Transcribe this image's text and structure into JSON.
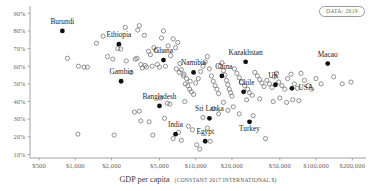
{
  "badge": {
    "label": "DATA: 2019",
    "name": "data-year-badge"
  },
  "chart_data": {
    "type": "scatter",
    "title": "",
    "subtitle": "",
    "xlabel": "GDP per capita",
    "xlabel_note": "(CONSTANT 2017 INTERNATIONAL $)",
    "ylabel": "",
    "xscale": "log",
    "yscale": "linear",
    "grid": false,
    "legend": "none",
    "xlim": [
      420,
      260000
    ],
    "ylim": [
      0.08,
      0.93
    ],
    "xticks": [
      500,
      1000,
      2000,
      5000,
      10000,
      20000,
      50000,
      100000,
      200000
    ],
    "xtick_labels": [
      "$500",
      "$1,000",
      "$2,000",
      "$5,000",
      "$10,000",
      "$20,000",
      "$50,000",
      "$100,000",
      "$200,000"
    ],
    "yticks": [
      0.1,
      0.2,
      0.3,
      0.4,
      0.5,
      0.6,
      0.7,
      0.8,
      0.9
    ],
    "ytick_labels": [
      "10%",
      "20%",
      "30%",
      "40%",
      "50%",
      "60%",
      "70%",
      "80%",
      "90%"
    ],
    "marker_styles": {
      "highlighted": "filled-black",
      "other": "open-circle"
    },
    "highlighted_points": [
      {
        "name": "Burundi",
        "x": 780,
        "y": 0.8,
        "label_dx": 0,
        "label_dy": -7
      },
      {
        "name": "Ethiopia",
        "x": 2300,
        "y": 0.725,
        "label_dx": 0,
        "label_dy": -7
      },
      {
        "name": "Ghana",
        "x": 5400,
        "y": 0.635,
        "label_dx": 0,
        "label_dy": -7
      },
      {
        "name": "Gambia",
        "x": 2400,
        "y": 0.515,
        "label_dx": 0,
        "label_dy": -7
      },
      {
        "name": "Namibia",
        "x": 9600,
        "y": 0.565,
        "label_dx": 0,
        "label_dy": -7
      },
      {
        "name": "Kazakhstan",
        "x": 26000,
        "y": 0.625,
        "label_dx": 0,
        "label_dy": -7
      },
      {
        "name": "China",
        "x": 16500,
        "y": 0.545,
        "label_dx": 2,
        "label_dy": -7
      },
      {
        "name": "Chile",
        "x": 25000,
        "y": 0.455,
        "label_dx": 3,
        "label_dy": -7
      },
      {
        "name": "UK",
        "x": 46000,
        "y": 0.495,
        "label_dx": -2,
        "label_dy": -7
      },
      {
        "name": "USA",
        "x": 63000,
        "y": 0.475,
        "label_dx": 14,
        "label_dy": 2
      },
      {
        "name": "Macao",
        "x": 125000,
        "y": 0.615,
        "label_dx": 0,
        "label_dy": -7
      },
      {
        "name": "Bangladesh",
        "x": 5000,
        "y": 0.375,
        "label_dx": 0,
        "label_dy": -7
      },
      {
        "name": "Sri Lanka",
        "x": 13000,
        "y": 0.305,
        "label_dx": 0,
        "label_dy": -7
      },
      {
        "name": "India",
        "x": 6800,
        "y": 0.215,
        "label_dx": 0,
        "label_dy": -7
      },
      {
        "name": "Egypt",
        "x": 12000,
        "y": 0.175,
        "label_dx": 0,
        "label_dy": -7
      },
      {
        "name": "Turkey",
        "x": 28000,
        "y": 0.285,
        "label_dx": 0,
        "label_dy": 9
      }
    ],
    "other_points": [
      {
        "x": 860,
        "y": 0.645
      },
      {
        "x": 1060,
        "y": 0.6
      },
      {
        "x": 1180,
        "y": 0.595
      },
      {
        "x": 1260,
        "y": 0.595
      },
      {
        "x": 1700,
        "y": 0.77
      },
      {
        "x": 2050,
        "y": 0.64
      },
      {
        "x": 2250,
        "y": 0.7
      },
      {
        "x": 2380,
        "y": 0.698
      },
      {
        "x": 2600,
        "y": 0.82
      },
      {
        "x": 2650,
        "y": 0.63
      },
      {
        "x": 2900,
        "y": 0.565
      },
      {
        "x": 3150,
        "y": 0.64
      },
      {
        "x": 3250,
        "y": 0.645
      },
      {
        "x": 3300,
        "y": 0.805
      },
      {
        "x": 3400,
        "y": 0.83
      },
      {
        "x": 3500,
        "y": 0.61
      },
      {
        "x": 3600,
        "y": 0.59
      },
      {
        "x": 3750,
        "y": 0.775
      },
      {
        "x": 3800,
        "y": 0.605
      },
      {
        "x": 3900,
        "y": 0.595
      },
      {
        "x": 4050,
        "y": 0.685
      },
      {
        "x": 4200,
        "y": 0.665
      },
      {
        "x": 4350,
        "y": 0.6
      },
      {
        "x": 4500,
        "y": 0.705
      },
      {
        "x": 4650,
        "y": 0.69
      },
      {
        "x": 4800,
        "y": 0.61
      },
      {
        "x": 5000,
        "y": 0.595
      },
      {
        "x": 5200,
        "y": 0.76
      },
      {
        "x": 5400,
        "y": 0.8
      },
      {
        "x": 5600,
        "y": 0.6
      },
      {
        "x": 5900,
        "y": 0.715
      },
      {
        "x": 6200,
        "y": 0.66
      },
      {
        "x": 6500,
        "y": 0.755
      },
      {
        "x": 6800,
        "y": 0.705
      },
      {
        "x": 7100,
        "y": 0.735
      },
      {
        "x": 7400,
        "y": 0.615
      },
      {
        "x": 7600,
        "y": 0.58
      },
      {
        "x": 7900,
        "y": 0.545
      },
      {
        "x": 8200,
        "y": 0.5
      },
      {
        "x": 8600,
        "y": 0.49
      },
      {
        "x": 8900,
        "y": 0.47
      },
      {
        "x": 9200,
        "y": 0.455
      },
      {
        "x": 9600,
        "y": 0.44
      },
      {
        "x": 10000,
        "y": 0.505
      },
      {
        "x": 10500,
        "y": 0.53
      },
      {
        "x": 11000,
        "y": 0.57
      },
      {
        "x": 11500,
        "y": 0.6
      },
      {
        "x": 12000,
        "y": 0.625
      },
      {
        "x": 12500,
        "y": 0.655
      },
      {
        "x": 13000,
        "y": 0.585
      },
      {
        "x": 13500,
        "y": 0.545
      },
      {
        "x": 14000,
        "y": 0.515
      },
      {
        "x": 14500,
        "y": 0.49
      },
      {
        "x": 15000,
        "y": 0.47
      },
      {
        "x": 15500,
        "y": 0.445
      },
      {
        "x": 16000,
        "y": 0.6
      },
      {
        "x": 16500,
        "y": 0.62
      },
      {
        "x": 17000,
        "y": 0.575
      },
      {
        "x": 17500,
        "y": 0.55
      },
      {
        "x": 18000,
        "y": 0.52
      },
      {
        "x": 18500,
        "y": 0.495
      },
      {
        "x": 19000,
        "y": 0.47
      },
      {
        "x": 19500,
        "y": 0.45
      },
      {
        "x": 20000,
        "y": 0.43
      },
      {
        "x": 21000,
        "y": 0.585
      },
      {
        "x": 22000,
        "y": 0.56
      },
      {
        "x": 23000,
        "y": 0.535
      },
      {
        "x": 24000,
        "y": 0.51
      },
      {
        "x": 25500,
        "y": 0.49
      },
      {
        "x": 27000,
        "y": 0.47
      },
      {
        "x": 28000,
        "y": 0.45
      },
      {
        "x": 29500,
        "y": 0.435
      },
      {
        "x": 31000,
        "y": 0.565
      },
      {
        "x": 32500,
        "y": 0.545
      },
      {
        "x": 34000,
        "y": 0.525
      },
      {
        "x": 35500,
        "y": 0.505
      },
      {
        "x": 37000,
        "y": 0.485
      },
      {
        "x": 39000,
        "y": 0.52
      },
      {
        "x": 41000,
        "y": 0.5
      },
      {
        "x": 43000,
        "y": 0.48
      },
      {
        "x": 45000,
        "y": 0.54
      },
      {
        "x": 47000,
        "y": 0.56
      },
      {
        "x": 49000,
        "y": 0.51
      },
      {
        "x": 52000,
        "y": 0.49
      },
      {
        "x": 55000,
        "y": 0.47
      },
      {
        "x": 58000,
        "y": 0.53
      },
      {
        "x": 62000,
        "y": 0.555
      },
      {
        "x": 66000,
        "y": 0.5
      },
      {
        "x": 70000,
        "y": 0.475
      },
      {
        "x": 75000,
        "y": 0.56
      },
      {
        "x": 80000,
        "y": 0.52
      },
      {
        "x": 86000,
        "y": 0.49
      },
      {
        "x": 92000,
        "y": 0.47
      },
      {
        "x": 100000,
        "y": 0.53
      },
      {
        "x": 110000,
        "y": 0.5
      },
      {
        "x": 140000,
        "y": 0.54
      },
      {
        "x": 165000,
        "y": 0.5
      },
      {
        "x": 195000,
        "y": 0.51
      },
      {
        "x": 1050,
        "y": 0.215
      },
      {
        "x": 2100,
        "y": 0.21
      },
      {
        "x": 3100,
        "y": 0.34
      },
      {
        "x": 3400,
        "y": 0.345
      },
      {
        "x": 3500,
        "y": 0.29
      },
      {
        "x": 4100,
        "y": 0.285
      },
      {
        "x": 4400,
        "y": 0.21
      },
      {
        "x": 5100,
        "y": 0.42
      },
      {
        "x": 5500,
        "y": 0.305
      },
      {
        "x": 5800,
        "y": 0.39
      },
      {
        "x": 6100,
        "y": 0.385
      },
      {
        "x": 6500,
        "y": 0.19
      },
      {
        "x": 7200,
        "y": 0.225
      },
      {
        "x": 7600,
        "y": 0.18
      },
      {
        "x": 8100,
        "y": 0.4
      },
      {
        "x": 8700,
        "y": 0.26
      },
      {
        "x": 9400,
        "y": 0.24
      },
      {
        "x": 10200,
        "y": 0.155
      },
      {
        "x": 10800,
        "y": 0.13
      },
      {
        "x": 11500,
        "y": 0.31
      },
      {
        "x": 12500,
        "y": 0.25
      },
      {
        "x": 13200,
        "y": 0.175
      },
      {
        "x": 14000,
        "y": 0.36
      },
      {
        "x": 15500,
        "y": 0.33
      },
      {
        "x": 17000,
        "y": 0.395
      },
      {
        "x": 18500,
        "y": 0.35
      },
      {
        "x": 20500,
        "y": 0.37
      },
      {
        "x": 23000,
        "y": 0.33
      },
      {
        "x": 26500,
        "y": 0.41
      },
      {
        "x": 30000,
        "y": 0.32
      },
      {
        "x": 34000,
        "y": 0.415
      },
      {
        "x": 38000,
        "y": 0.19
      },
      {
        "x": 44000,
        "y": 0.4
      },
      {
        "x": 50000,
        "y": 0.42
      },
      {
        "x": 57000,
        "y": 0.395
      },
      {
        "x": 64000,
        "y": 0.41
      },
      {
        "x": 72000,
        "y": 0.405
      },
      {
        "x": 1500,
        "y": 0.73
      },
      {
        "x": 1850,
        "y": 0.655
      },
      {
        "x": 6900,
        "y": 0.585
      },
      {
        "x": 7300,
        "y": 0.565
      },
      {
        "x": 8000,
        "y": 0.555
      },
      {
        "x": 8400,
        "y": 0.53
      },
      {
        "x": 9000,
        "y": 0.515
      }
    ]
  }
}
